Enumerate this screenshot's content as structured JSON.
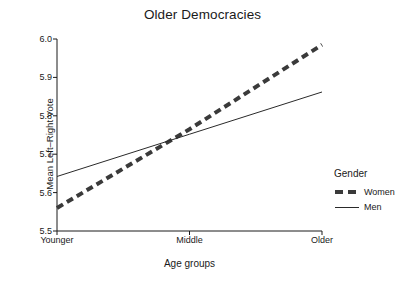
{
  "chart_data": {
    "type": "line",
    "title": "Older Democracies",
    "xlabel": "Age groups",
    "ylabel": "Mean Left–Right Vote",
    "categories": [
      "Younger",
      "Middle",
      "Older"
    ],
    "x": [
      0,
      1,
      2
    ],
    "xlim": [
      0,
      2
    ],
    "ylim": [
      5.5,
      6.0
    ],
    "yticks": [
      "5.5",
      "5.6",
      "5.7",
      "5.8",
      "5.9",
      "6.0"
    ],
    "ytick_values": [
      5.5,
      5.6,
      5.7,
      5.8,
      5.9,
      6.0
    ],
    "grid": false,
    "legend_position": "right",
    "legend_title": "Gender",
    "series": [
      {
        "name": "Women",
        "values": [
          5.56,
          5.765,
          5.985
        ],
        "style": "dashed",
        "color": "#3a3a3a",
        "width": 4
      },
      {
        "name": "Men",
        "values": [
          5.642,
          5.752,
          5.862
        ],
        "style": "solid",
        "color": "#2a2a2a",
        "width": 1
      }
    ],
    "annotations": []
  }
}
